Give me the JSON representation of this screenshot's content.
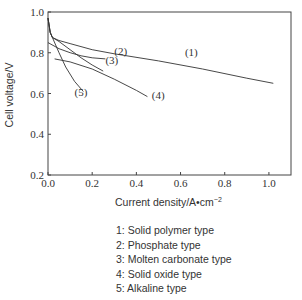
{
  "chart_data": {
    "type": "line",
    "title": "",
    "xlabel": "Current density/A•cm",
    "xlabel_sup": "−2",
    "ylabel": "Cell voltage/V",
    "xlim": [
      0.0,
      1.1
    ],
    "ylim": [
      0.2,
      1.0
    ],
    "xticks": [
      "0.0",
      "0.2",
      "0.4",
      "0.6",
      "0.8",
      "1.0"
    ],
    "yticks": [
      "0.2",
      "0.4",
      "0.6",
      "0.8",
      "1.0"
    ],
    "grid": false,
    "series": [
      {
        "name": "(1)",
        "label_pos": [
          0.62,
          0.785
        ],
        "x": [
          0.0,
          0.01,
          0.02,
          0.05,
          0.1,
          0.2,
          0.3,
          0.5,
          0.7,
          0.9,
          1.02
        ],
        "y": [
          0.97,
          0.9,
          0.875,
          0.86,
          0.845,
          0.815,
          0.795,
          0.76,
          0.72,
          0.675,
          0.65
        ]
      },
      {
        "name": "(2)",
        "label_pos": [
          0.3,
          0.79
        ],
        "x": [
          0.0,
          0.05,
          0.1,
          0.15,
          0.2,
          0.26
        ],
        "y": [
          0.85,
          0.82,
          0.8,
          0.785,
          0.775,
          0.77
        ]
      },
      {
        "name": "(3)",
        "label_pos": [
          0.26,
          0.745
        ],
        "x": [
          0.0,
          0.01,
          0.02,
          0.05,
          0.1,
          0.15,
          0.2,
          0.25
        ],
        "y": [
          0.97,
          0.9,
          0.875,
          0.855,
          0.815,
          0.775,
          0.74,
          0.71
        ]
      },
      {
        "name": "(4)",
        "label_pos": [
          0.47,
          0.575
        ],
        "x": [
          0.03,
          0.1,
          0.2,
          0.3,
          0.4,
          0.45
        ],
        "y": [
          0.77,
          0.755,
          0.72,
          0.67,
          0.615,
          0.585
        ]
      },
      {
        "name": "(5)",
        "label_pos": [
          0.12,
          0.59
        ],
        "x": [
          0.0,
          0.01,
          0.02,
          0.05,
          0.08,
          0.12,
          0.16
        ],
        "y": [
          0.97,
          0.9,
          0.875,
          0.8,
          0.73,
          0.66,
          0.61
        ]
      }
    ],
    "legend": [
      "1: Solid polymer type",
      "2: Phosphate type",
      "3: Molten carbonate type",
      "4: Solid oxide type",
      "5: Alkaline type"
    ],
    "legend_placement": "bottom"
  }
}
